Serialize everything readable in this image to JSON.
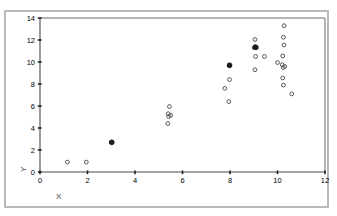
{
  "window": {
    "label": "plot-window"
  },
  "chart_data": {
    "type": "scatter",
    "title": "",
    "xlabel": "X",
    "ylabel": "Y",
    "xlim": [
      0,
      12
    ],
    "ylim": [
      0,
      14
    ],
    "xticks": [
      0,
      2,
      4,
      6,
      8,
      10,
      12
    ],
    "yticks": [
      0,
      2,
      4,
      6,
      8,
      10,
      12,
      14
    ],
    "xtick_labels": [
      "0",
      "2",
      "4",
      "6",
      "8",
      "10",
      "12"
    ],
    "ytick_labels": [
      "0",
      "2",
      "4",
      "6",
      "8",
      "10",
      "12",
      "14"
    ],
    "grid": false,
    "legend": false,
    "marker_open": "open-circle",
    "marker_filled": "filled-circle",
    "series": [
      {
        "name": "open",
        "marker": "open-circle",
        "points": [
          [
            1.15,
            0.9
          ],
          [
            1.95,
            0.9
          ],
          [
            5.45,
            5.95
          ],
          [
            5.4,
            5.3
          ],
          [
            5.5,
            5.15
          ],
          [
            5.42,
            5.05
          ],
          [
            5.38,
            4.4
          ],
          [
            7.98,
            8.4
          ],
          [
            7.78,
            7.6
          ],
          [
            7.95,
            6.4
          ],
          [
            9.05,
            12.05
          ],
          [
            9.02,
            11.3
          ],
          [
            9.12,
            11.3
          ],
          [
            9.08,
            10.5
          ],
          [
            9.45,
            10.5
          ],
          [
            9.05,
            9.3
          ],
          [
            10.0,
            9.95
          ],
          [
            10.28,
            13.3
          ],
          [
            10.25,
            12.25
          ],
          [
            10.27,
            11.55
          ],
          [
            10.22,
            10.55
          ],
          [
            10.2,
            9.75
          ],
          [
            10.3,
            9.6
          ],
          [
            10.24,
            9.5
          ],
          [
            10.22,
            8.55
          ],
          [
            10.25,
            7.9
          ],
          [
            10.6,
            7.1
          ]
        ]
      },
      {
        "name": "filled",
        "marker": "filled-circle",
        "points": [
          [
            3.02,
            2.7
          ],
          [
            7.98,
            9.7
          ],
          [
            9.07,
            11.35
          ]
        ]
      }
    ]
  },
  "colors": {
    "frame": "#b9b9b9",
    "axis": "#4a4a4a",
    "marker_open_stroke": "#555555",
    "marker_filled": "#1a1a1a",
    "text": "#000000",
    "axis_title": "#444444",
    "background": "#ffffff"
  }
}
